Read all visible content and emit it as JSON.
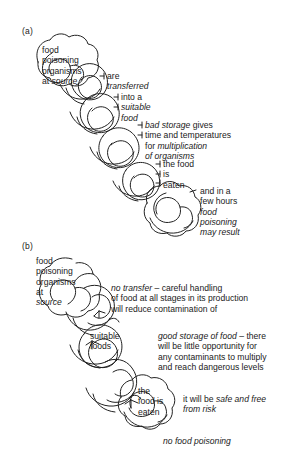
{
  "figure": {
    "type": "diagram",
    "background_color": "#ffffff",
    "line_color": "#222222"
  },
  "panel_a": {
    "label": "(a)",
    "links": [
      {
        "id": "link-a-1",
        "lines": [
          {
            "text": "food",
            "style": "normal"
          },
          {
            "text": "poisoning",
            "style": "normal"
          },
          {
            "text": "organisms",
            "style": "normal"
          },
          {
            "text": "at ",
            "style": "normal",
            "tail": "source",
            "tail_style": "italic"
          }
        ]
      },
      {
        "id": "link-a-2",
        "lines": [
          {
            "text": "are",
            "style": "normal"
          },
          {
            "text": "transferred",
            "style": "italic"
          }
        ]
      },
      {
        "id": "link-a-3",
        "lines": [
          {
            "text": "into a",
            "style": "normal"
          },
          {
            "text": "suitable",
            "style": "italic"
          },
          {
            "text": "food",
            "style": "italic"
          }
        ]
      },
      {
        "id": "link-a-4",
        "lines": [
          {
            "text": "bad storage",
            "style": "italic",
            "tail": " gives",
            "tail_style": "normal"
          },
          {
            "text": "time and temperatures",
            "style": "normal"
          },
          {
            "text": "for ",
            "style": "normal",
            "tail": "multiplication",
            "tail_style": "italic"
          },
          {
            "text": "of organisms",
            "style": "italic"
          }
        ]
      },
      {
        "id": "link-a-5",
        "lines": [
          {
            "text": "the food",
            "style": "normal"
          },
          {
            "text": "is",
            "style": "normal"
          },
          {
            "text": "eaten",
            "style": "normal"
          }
        ]
      },
      {
        "id": "link-a-6",
        "lines": [
          {
            "text": "and in a",
            "style": "normal"
          },
          {
            "text": "few hours",
            "style": "normal"
          },
          {
            "text": "food",
            "style": "italic"
          },
          {
            "text": "poisoning",
            "style": "italic"
          },
          {
            "text": "may result",
            "style": "italic"
          }
        ]
      }
    ]
  },
  "panel_b": {
    "label": "(b)",
    "links": [
      {
        "id": "link-b-1",
        "lines": [
          {
            "text": "food",
            "style": "normal"
          },
          {
            "text": "poisoning",
            "style": "normal"
          },
          {
            "text": "organisms",
            "style": "normal"
          },
          {
            "text": "at",
            "style": "normal"
          },
          {
            "text": "source",
            "style": "italic"
          }
        ]
      },
      {
        "id": "link-b-2",
        "lines": [
          {
            "text": "no transfer",
            "style": "italic",
            "tail": " – careful handling",
            "tail_style": "normal"
          },
          {
            "text": "of food at all stages in its production",
            "style": "normal"
          },
          {
            "text": "will reduce contamination of",
            "style": "normal"
          }
        ]
      },
      {
        "id": "link-b-3",
        "lines": [
          {
            "text": "suitable",
            "style": "normal"
          },
          {
            "text": "foods",
            "style": "normal"
          }
        ]
      },
      {
        "id": "link-b-4",
        "lines": [
          {
            "text": "good storage of food",
            "style": "italic",
            "tail": " – there",
            "tail_style": "normal"
          },
          {
            "text": "will be little opportunity for",
            "style": "normal"
          },
          {
            "text": "any contaminants to multiply",
            "style": "normal"
          },
          {
            "text": "and reach dangerous levels",
            "style": "normal"
          }
        ]
      },
      {
        "id": "link-b-5",
        "lines": [
          {
            "text": "the",
            "style": "normal"
          },
          {
            "text": "food is",
            "style": "normal"
          },
          {
            "text": "eaten",
            "style": "normal"
          }
        ]
      },
      {
        "id": "link-b-6",
        "lines": [
          {
            "text": "it will be ",
            "style": "normal",
            "tail": "safe and free",
            "tail_style": "italic"
          },
          {
            "text": "from risk",
            "style": "italic"
          }
        ]
      }
    ],
    "conclusion": {
      "text": "no food poisoning",
      "style": "italic"
    }
  },
  "text": {
    "a_label": "(a)",
    "b_label": "(b)",
    "a1_l1": "food",
    "a1_l2": "poisoning",
    "a1_l3": "organisms",
    "a1_l4a": "at ",
    "a1_l4b": "source",
    "a2_l1": "are",
    "a2_l2": "transferred",
    "a3_l1": "into a",
    "a3_l2": "suitable",
    "a3_l3": "food",
    "a4_l1a": "bad storage",
    "a4_l1b": " gives",
    "a4_l2": "time and temperatures",
    "a4_l3a": "for ",
    "a4_l3b": "multiplication",
    "a4_l4": "of organisms",
    "a5_l1": "the food",
    "a5_l2": "is",
    "a5_l3": "eaten",
    "a6_l1": "and in a",
    "a6_l2": "few hours",
    "a6_l3": "food",
    "a6_l4": "poisoning",
    "a6_l5": "may result",
    "b1_l1": "food",
    "b1_l2": "poisoning",
    "b1_l3": "organisms",
    "b1_l4": "at",
    "b1_l5": "source",
    "b2_l1a": "no transfer",
    "b2_l1b": " – careful handling",
    "b2_l2": "of food at all stages in its production",
    "b2_l3": "will reduce contamination of",
    "b3_l1": "suitable",
    "b3_l2": "foods",
    "b4_l1a": "good storage of food",
    "b4_l1b": " – there",
    "b4_l2": "will be little opportunity for",
    "b4_l3": "any contaminants to multiply",
    "b4_l4": "and reach dangerous levels",
    "b5_l1": "the",
    "b5_l2": "food is",
    "b5_l3": "eaten",
    "b6_l1a": "it will be ",
    "b6_l1b": "safe and free",
    "b6_l2": "from risk",
    "b_conclusion": "no food poisoning"
  }
}
